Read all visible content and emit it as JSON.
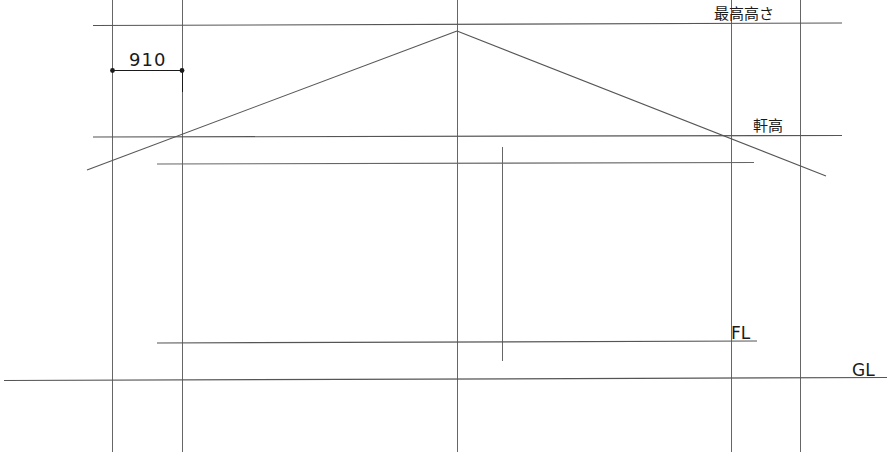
{
  "drawing": {
    "type": "architectural-elevation",
    "title": "建物立面図",
    "canvas": {
      "width": 887,
      "height": 464
    },
    "line_color": "#555555",
    "text_color": "#1a1a1a",
    "labels": {
      "max_height": "最高高さ",
      "eaves_height": "軒高",
      "floor_level": "FL",
      "ground_level": "GL"
    },
    "dimension": {
      "value": "910",
      "unit_implied": "mm",
      "from_x": 112,
      "to_x": 182,
      "y": 70
    },
    "levels": [
      {
        "name": "最高高さ",
        "y": 23,
        "x_start": 93,
        "x_end": 842
      },
      {
        "name": "軒高",
        "y": 136,
        "x_start": 93,
        "x_end": 842
      },
      {
        "name": "FL",
        "y": 342,
        "x_start": 157,
        "x_end": 757
      },
      {
        "name": "GL",
        "y": 379,
        "x_start": 4,
        "x_end": 887
      }
    ],
    "verticals": [
      {
        "x": 112,
        "y_top": 0,
        "y_bottom": 452
      },
      {
        "x": 182,
        "y_top": 0,
        "y_bottom": 452
      },
      {
        "x": 457,
        "y_top": 0,
        "y_bottom": 452
      },
      {
        "x": 731,
        "y_top": 0,
        "y_bottom": 452
      },
      {
        "x": 800,
        "y_top": 0,
        "y_bottom": 452
      },
      {
        "x": 502,
        "y_top": 147,
        "y_bottom": 361
      }
    ],
    "roof": {
      "apex_x": 457,
      "apex_y": 31,
      "left_end_x": 87,
      "left_end_y": 170,
      "right_end_x": 826,
      "right_end_y": 176
    },
    "wall_top": {
      "y": 163,
      "x_start": 157,
      "x_end": 754
    }
  }
}
